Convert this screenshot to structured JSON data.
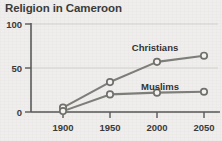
{
  "chart_data": {
    "type": "line",
    "title": "Religion in Cameroon",
    "xlabel": "",
    "ylabel": "",
    "x": [
      1900,
      1950,
      2000,
      2050
    ],
    "xtick_labels": [
      "1900",
      "1950",
      "2000",
      "2050"
    ],
    "ytick_labels": [
      "0",
      "50",
      "100"
    ],
    "yticks": [
      0,
      50,
      100
    ],
    "ylim": [
      0,
      100
    ],
    "xlim": [
      1900,
      2050
    ],
    "grid": "horizontal",
    "legend": "inline-labels",
    "series": [
      {
        "name": "Christians",
        "label": "Christians",
        "values": [
          5,
          34,
          57,
          64
        ],
        "color": "#7d7d79"
      },
      {
        "name": "Muslims",
        "label": "Muslims",
        "values": [
          1,
          20,
          22,
          23
        ],
        "color": "#7d7d79"
      }
    ]
  },
  "ticks": {
    "y0": "0",
    "y50": "50",
    "y100": "100",
    "x1900": "1900",
    "x1950": "1950",
    "x2000": "2000",
    "x2050": "2050"
  },
  "labels": {
    "christians": "Christians",
    "muslims": "Muslims"
  }
}
